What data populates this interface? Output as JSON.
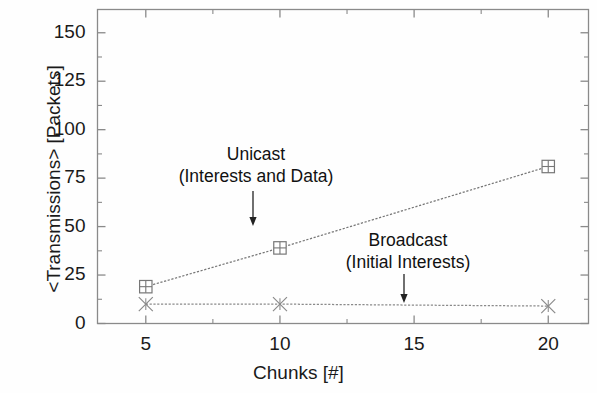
{
  "chart_data": {
    "type": "line",
    "title": "",
    "xlabel": "Chunks [#]",
    "ylabel": "<Transmissions> [Packets]",
    "xlim": [
      3.2,
      21.5
    ],
    "ylim": [
      0,
      162
    ],
    "xticks": [
      5,
      10,
      15,
      20
    ],
    "xtick_labels": [
      "5",
      "10",
      "15",
      "20"
    ],
    "yticks": [
      0,
      25,
      50,
      75,
      100,
      125,
      150
    ],
    "ytick_labels": [
      "0",
      "25",
      "50",
      "75",
      "100",
      "125",
      "150"
    ],
    "x_minor_ticks": [
      7.5,
      12.5,
      17.5
    ],
    "y_minor_ticks": [
      12.5,
      37.5,
      62.5,
      87.5,
      112.5,
      137.5,
      162.5
    ],
    "grid": false,
    "legend_position": "none",
    "frame": true,
    "series": [
      {
        "name": "Unicast (Interests and Data)",
        "marker": "square-plus",
        "color": "#777777",
        "x": [
          5,
          10,
          20
        ],
        "values": [
          19,
          39,
          81
        ]
      },
      {
        "name": "Broadcast (Initial Interests)",
        "marker": "x-asterisk",
        "color": "#8a8a8a",
        "x": [
          5,
          10,
          20
        ],
        "values": [
          10,
          10,
          9
        ]
      }
    ],
    "annotations": [
      {
        "id": "unicast",
        "line1": "Unicast",
        "line2": "(Interests and Data)",
        "text_x": 256,
        "text_y": 143,
        "arrow_x": 253,
        "arrow_y0": 191,
        "arrow_y1": 226
      },
      {
        "id": "broadcast",
        "line1": "Broadcast",
        "line2": "(Initial Interests)",
        "text_x": 408,
        "text_y": 229,
        "arrow_x": 404,
        "arrow_y0": 274,
        "arrow_y1": 303
      }
    ],
    "colors": {
      "axis": "#8a8a8a",
      "text": "#1a1a1a",
      "unicast": "#888888",
      "broadcast": "#909090",
      "background": "#fefefe"
    }
  }
}
